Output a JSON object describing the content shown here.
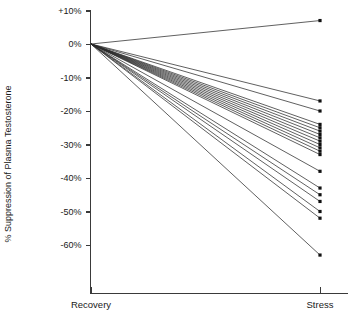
{
  "chart_data": {
    "type": "line",
    "title": "",
    "subtitle": "",
    "xlabel": "",
    "ylabel": "% Suppression of Plasma Testosterone",
    "categories": [
      "Recovery",
      "Stress"
    ],
    "x_tick_labels": [
      "Recovery",
      "Stress"
    ],
    "y_tick_labels": [
      "+10%",
      "0%",
      "-10%",
      "-20%",
      "-30%",
      "-40%",
      "-50%",
      "-60%"
    ],
    "y_tick_values": [
      10,
      0,
      -10,
      -20,
      -30,
      -40,
      -50,
      -60
    ],
    "ylim": [
      -68,
      12
    ],
    "xlim": [
      0,
      1
    ],
    "grid": false,
    "legend": false,
    "legend_position": "none",
    "annotations": [],
    "marker": "square",
    "series": [
      {
        "name": "subject-1",
        "values": [
          0,
          7
        ]
      },
      {
        "name": "subject-2",
        "values": [
          0,
          -17
        ]
      },
      {
        "name": "subject-3",
        "values": [
          0,
          -20
        ]
      },
      {
        "name": "subject-4",
        "values": [
          0,
          -24
        ]
      },
      {
        "name": "subject-5",
        "values": [
          0,
          -25
        ]
      },
      {
        "name": "subject-6",
        "values": [
          0,
          -26
        ]
      },
      {
        "name": "subject-7",
        "values": [
          0,
          -27
        ]
      },
      {
        "name": "subject-8",
        "values": [
          0,
          -28
        ]
      },
      {
        "name": "subject-9",
        "values": [
          0,
          -29
        ]
      },
      {
        "name": "subject-10",
        "values": [
          0,
          -30
        ]
      },
      {
        "name": "subject-11",
        "values": [
          0,
          -31
        ]
      },
      {
        "name": "subject-12",
        "values": [
          0,
          -32
        ]
      },
      {
        "name": "subject-13",
        "values": [
          0,
          -33
        ]
      },
      {
        "name": "subject-14",
        "values": [
          0,
          -38
        ]
      },
      {
        "name": "subject-15",
        "values": [
          0,
          -43
        ]
      },
      {
        "name": "subject-16",
        "values": [
          0,
          -45
        ]
      },
      {
        "name": "subject-17",
        "values": [
          0,
          -47
        ]
      },
      {
        "name": "subject-18",
        "values": [
          0,
          -50
        ]
      },
      {
        "name": "subject-19",
        "values": [
          0,
          -52
        ]
      },
      {
        "name": "subject-20",
        "values": [
          0,
          -63
        ]
      }
    ]
  },
  "axes": {
    "y_title": "% Suppression of Plasma Testosterone",
    "y_ticks": [
      {
        "label": "+10%",
        "value": 10
      },
      {
        "label": "0%",
        "value": 0
      },
      {
        "label": "-10%",
        "value": -10
      },
      {
        "label": "-20%",
        "value": -20
      },
      {
        "label": "-30%",
        "value": -30
      },
      {
        "label": "-40%",
        "value": -40
      },
      {
        "label": "-50%",
        "value": -50
      },
      {
        "label": "-60%",
        "value": -60
      }
    ],
    "x_ticks": [
      {
        "label": "Recovery",
        "value": 0
      },
      {
        "label": "Stress",
        "value": 1
      }
    ]
  },
  "colors": {
    "line": "#2b2b2b",
    "point": "#111111",
    "axis": "#3a3a3a",
    "text": "#1a1a1a",
    "background": "#ffffff"
  }
}
